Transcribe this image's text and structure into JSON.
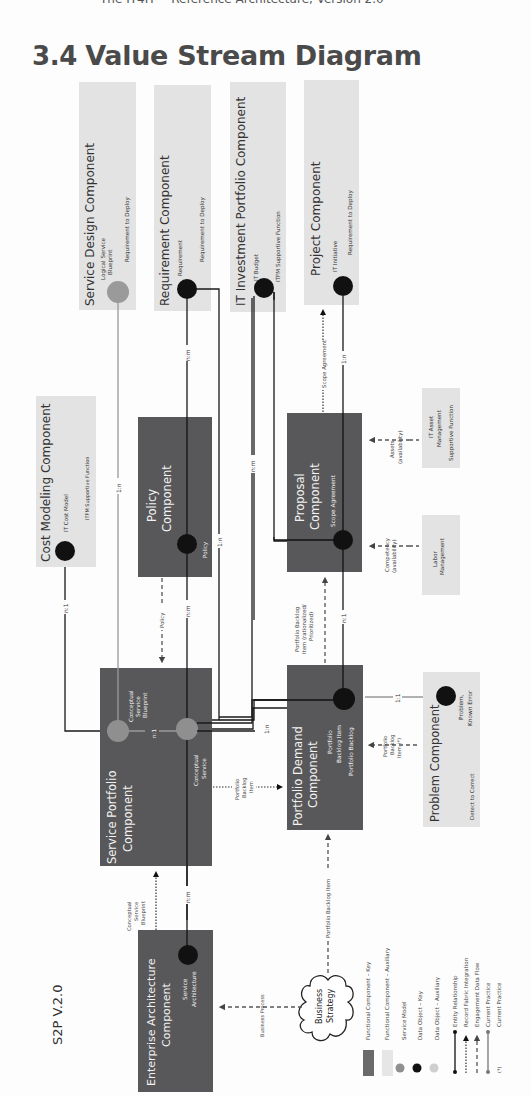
{
  "header": {
    "running_title": "The IT4IT™ Reference Architecture, Version 2.0"
  },
  "title": {
    "number": "3.4",
    "text": "Value Stream Diagram"
  },
  "diagram": {
    "value_stream_label": "S2P V.2.0",
    "colors": {
      "functional_key": "#58585a",
      "functional_aux": "#e3e3e3",
      "service_model": "#8f8f8f",
      "data_object_key": "#111111",
      "data_object_aux": "#bdbdbd",
      "line": "#1a1a1a"
    },
    "components": {
      "service_design": {
        "title": "Service Design Component",
        "data_object": "Logical Service Blueprint",
        "data_object_l1": "Logical Service",
        "data_object_l2": "Blueprint",
        "value_stream": "Requirement to Deploy"
      },
      "requirement": {
        "title": "Requirement Component",
        "data_object": "Requirement",
        "value_stream": "Requirement to Deploy"
      },
      "it_investment_portfolio": {
        "title": "IT Investment Portfolio Component",
        "data_object": "IT Budget",
        "value_stream": "ITFM Supportive Function"
      },
      "project": {
        "title": "Project Component",
        "data_object": "IT Initiative",
        "value_stream": "Requirement to Deploy"
      },
      "cost_modeling": {
        "title": "Cost Modeling Component",
        "data_object": "IT Cost Model",
        "value_stream": "ITFM Supportive Function"
      },
      "policy": {
        "title_l1": "Policy",
        "title_l2": "Component",
        "data_object": "Policy"
      },
      "proposal": {
        "title_l1": "Proposal",
        "title_l2": "Component",
        "data_object": "Scope Agreement"
      },
      "labor_management": {
        "title_l1": "Labor",
        "title_l2": "Management"
      },
      "it_asset_management": {
        "title_l1": "IT Asset",
        "title_l2": "Management",
        "value_stream": "Supportive Function"
      },
      "service_portfolio": {
        "title_l1": "Service Portfolio",
        "title_l2": "Component",
        "data_object_1_l1": "Conceptual",
        "data_object_1_l2": "Service",
        "data_object_1_l3": "Blueprint",
        "data_object_2_l1": "Conceptual",
        "data_object_2_l2": "Service",
        "internal_relation": "n:1"
      },
      "portfolio_demand": {
        "title_l1": "Portfolio Demand",
        "title_l2": "Component",
        "data_object_l1": "Portfolio",
        "data_object_l2": "Backlog Item",
        "data_object_l3": "Portfolio Backlog"
      },
      "problem": {
        "title": "Problem Component",
        "data_object_l1": "Problem,",
        "data_object_l2": "Known Error",
        "value_stream": "Detect to Correct"
      },
      "enterprise_architecture": {
        "title_l1": "Enterprise Architecture",
        "title_l2": "Component",
        "data_object_l1": "Service",
        "data_object_l2": "Architecture"
      },
      "business_strategy": {
        "title_l1": "Business",
        "title_l2": "Strategy"
      }
    },
    "relationships": {
      "service_design_to_sp": "1:n",
      "requirement_to_policy": "n:m",
      "it_budget_to_proposal": "n:m",
      "project_to_proposal": "1:n",
      "cost_model_to_sp": "n:1",
      "policy_to_sp": "n:m",
      "requirement_to_pd": "1:n",
      "proposal_to_pd": "n:1",
      "pd_to_sp": "1:n",
      "pd_to_problem": "1:1",
      "ea_to_sp": "n:m"
    },
    "flows": {
      "policy": "Policy",
      "scope_agreement": "Scope Agreement",
      "portfolio_backlog_rationalized_l1": "Portfolio Backlog",
      "portfolio_backlog_rationalized_l2": "Item (rationalized/",
      "portfolio_backlog_rationalized_l3": "Prioritized)",
      "competency_l1": "Competency",
      "competency_l2": "(availability)",
      "assets_l1": "Assets",
      "assets_l2": "(availability)",
      "portfolio_backlog_item_l1": "Portfolio",
      "portfolio_backlog_item_l2": "Backlog",
      "portfolio_backlog_item_l3": "Item",
      "problem_backlog_l1": "Portfolio",
      "problem_backlog_l2": "Backlog",
      "problem_backlog_l3": "Item (*)",
      "conceptual_blueprint_l1": "Conceptual",
      "conceptual_blueprint_l2": "Service",
      "conceptual_blueprint_l3": "Blueprint",
      "business_process": "Business Process",
      "strategy_backlog_item": "Portfolio Backlog Item"
    }
  },
  "legend": {
    "items": [
      {
        "label": "Functional Component – Key",
        "symbol": "dark-rect"
      },
      {
        "label": "Functional Component – Auxiliary",
        "symbol": "light-rect"
      },
      {
        "label": "Service Model",
        "symbol": "gray-circle"
      },
      {
        "label": "Data Object – Key",
        "symbol": "black-circle"
      },
      {
        "label": "Data Object – Auxiliary",
        "symbol": "light-circle"
      },
      {
        "label": "Entity Relationship",
        "symbol": "solid-line"
      },
      {
        "label": "Record Fabric Integration",
        "symbol": "dotted-arrow"
      },
      {
        "label": "Engagement Data Flow",
        "symbol": "dashed-arrow"
      },
      {
        "label": "Current Practice",
        "symbol": "gray-line"
      },
      {
        "label": "Current Practice",
        "symbol": "asterisk"
      }
    ],
    "asterisk_symbol": "(*)"
  }
}
